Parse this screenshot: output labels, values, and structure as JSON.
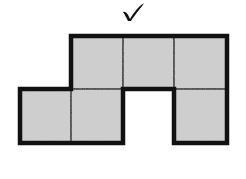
{
  "figure": {
    "check_mark": {
      "symbol": "check",
      "color": "#111111"
    },
    "grid": {
      "cell_size": 51.5,
      "origin_x": 20,
      "origin_y": 36,
      "columns": 4,
      "rows": 2
    },
    "cells": [
      {
        "row": 0,
        "col": 1
      },
      {
        "row": 0,
        "col": 2
      },
      {
        "row": 0,
        "col": 3
      },
      {
        "row": 1,
        "col": 0
      },
      {
        "row": 1,
        "col": 1
      },
      {
        "row": 1,
        "col": 3
      }
    ],
    "cell_count": 6,
    "colors": {
      "fill": "#d2d2d2",
      "outline": "#111111",
      "inner_line": "#1a1a1a",
      "background": "#ffffff"
    }
  }
}
